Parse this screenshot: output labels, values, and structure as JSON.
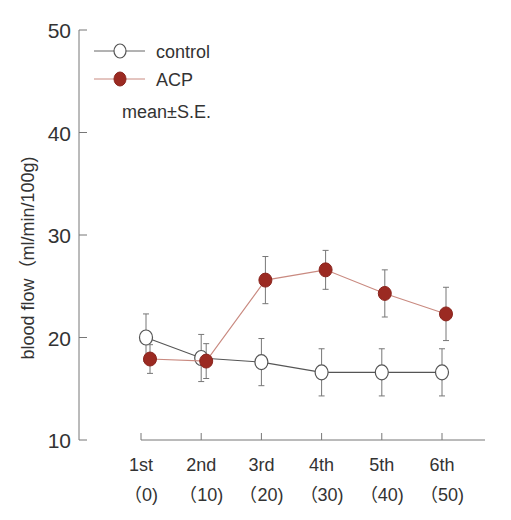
{
  "chart_data": {
    "type": "line",
    "title": "",
    "xlabel": "",
    "ylabel": "blood flow（ml/min/100g)",
    "ylim": [
      10,
      50
    ],
    "yticks": [
      10,
      20,
      30,
      40,
      50
    ],
    "grid": false,
    "legend_position": "upper-left",
    "categories": [
      "1st",
      "2nd",
      "3rd",
      "4th",
      "5th",
      "6th"
    ],
    "category_sublabels": [
      "（0)",
      "（10)",
      "（20)",
      "（30)",
      "（40)",
      "（50)"
    ],
    "series": [
      {
        "name": "control",
        "marker": "open-circle",
        "color": "#555555",
        "values": [
          20.0,
          18.0,
          17.6,
          16.6,
          16.6,
          16.6
        ],
        "errors": [
          2.3,
          2.3,
          2.3,
          2.3,
          2.3,
          2.3
        ]
      },
      {
        "name": "ACP",
        "marker": "filled-circle",
        "color": "#9b2a22",
        "line_color": "#c98a80",
        "values": [
          17.9,
          17.7,
          25.6,
          26.6,
          24.3,
          22.3
        ],
        "errors": [
          1.4,
          1.7,
          2.3,
          1.9,
          2.3,
          2.6
        ]
      }
    ],
    "annotations": [
      "mean±S.E."
    ]
  },
  "legend": {
    "items": [
      {
        "label": "control"
      },
      {
        "label": "ACP"
      }
    ],
    "note": "mean±S.E."
  }
}
